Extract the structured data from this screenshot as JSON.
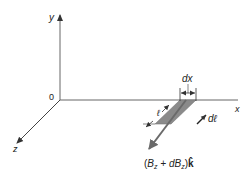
{
  "diagram": {
    "axes": {
      "x_label": "x",
      "y_label": "y",
      "z_label": "z",
      "origin_label": "0"
    },
    "element": {
      "width_label": "dx",
      "length_label": "ℓ",
      "path_label": "dℓ",
      "field_label_parts": {
        "open": "(",
        "b": "B",
        "sub1": "z",
        "plus": " + d",
        "b2": "B",
        "sub2": "z",
        "close": ")",
        "unit": "k̂"
      }
    },
    "colors": {
      "axis": "#555555",
      "shade": "#8a8a8a",
      "field_arrow": "#6a6a6a",
      "text": "#222222"
    }
  }
}
